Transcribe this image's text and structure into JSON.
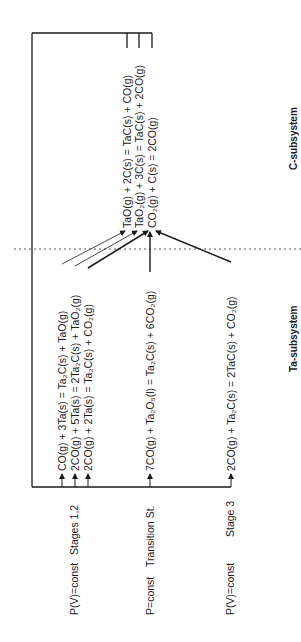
{
  "diagram": {
    "orientation": "rotated -90deg (read bottom-to-top)",
    "colors": {
      "line": "#1a1a1a",
      "background": "#ffffff",
      "divider": "#555555"
    },
    "subsystems": {
      "ta": {
        "label": "Ta-subsystem"
      },
      "c": {
        "label": "C-subsystem"
      }
    },
    "stages": [
      {
        "condition": "P(V)=const",
        "stage": "Stages 1,2"
      },
      {
        "condition": "P=const",
        "stage": "Transition St."
      },
      {
        "condition": "P(V)=const",
        "stage": "Stage 3"
      }
    ],
    "ta_reactions": [
      {
        "id": "r1",
        "text": "CO(g) + 3Ta(s) =  Ta₂C(s) + TaO(g)"
      },
      {
        "id": "r2",
        "text": "2CO(g) + 5Ta(s) = 2Ta₂C(s) + TaO₂(g)"
      },
      {
        "id": "r3",
        "text": "2CO(g) + 2Ta(s) =  Ta₂C(s) + CO₂(g)"
      },
      {
        "id": "r4",
        "text": "7CO(g) + Ta₂O₅(l) = Ta₂C(s) + 6CO₂(g)"
      },
      {
        "id": "r5",
        "text": "2CO(g) +  Ta₂C(s) = 2TaC(s) + CO₂(g)"
      }
    ],
    "c_reactions": [
      {
        "id": "c1",
        "text": "TaO(g)  + 2C(s) = TaC(s) +  CO(g)"
      },
      {
        "id": "c2",
        "text": "TaO₂(g) + 3C(s) = TaC(s) + 2CO(g)"
      },
      {
        "id": "c3",
        "text": "CO₂(g)  +  C(s) =                 2CO(g)"
      }
    ]
  }
}
